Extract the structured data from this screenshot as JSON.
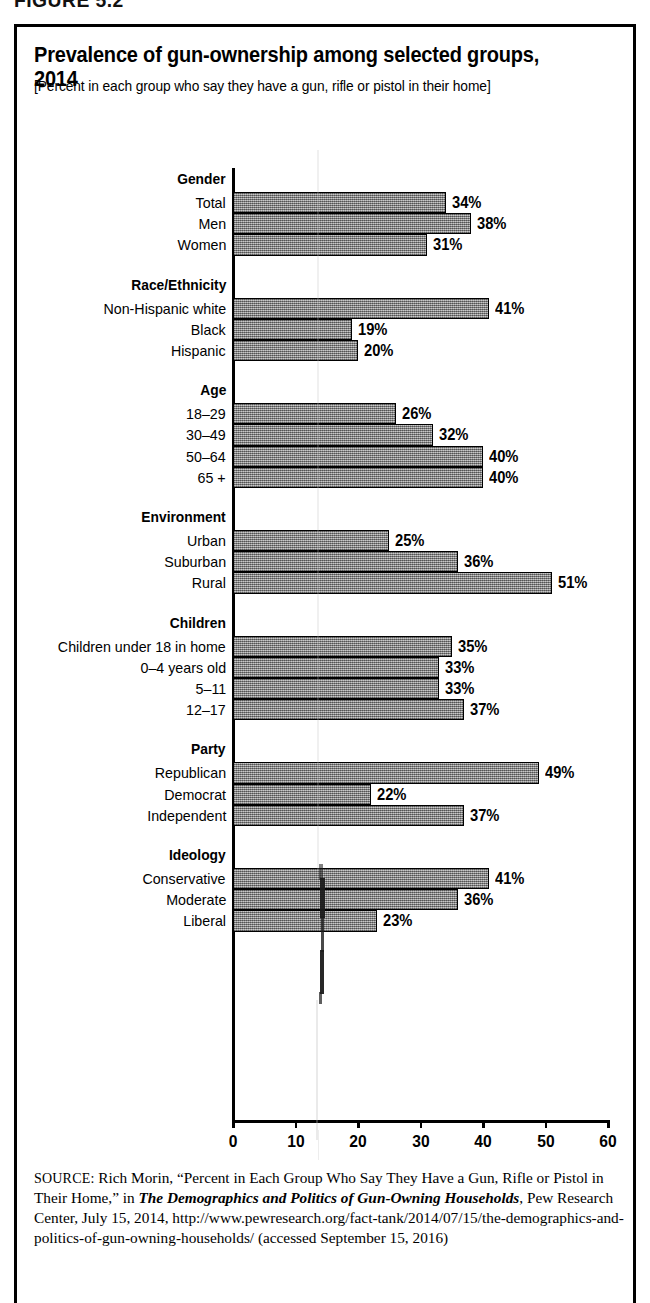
{
  "figure_label": "FIGURE 5.2",
  "title": "Prevalence of gun-ownership among selected groups, 2014",
  "subtitle": "[Percent in each group who say they have a gun, rifle or pistol in their home]",
  "source": {
    "prefix": "SOURCE:",
    "part1": " Rich Morin, “Percent in Each Group Who Say They Have a Gun, Rifle or Pistol in Their Home,” in ",
    "italic1": "The Demographics and Politics of Gun-Owning Households",
    "part2": ", Pew Research Center, July 15, 2014, http://www.pewresearch.org/fact-tank/2014/07/15/the-demographics-and-politics-of-gun-owning-households/ (accessed September 15, 2016)"
  },
  "chart_data": {
    "type": "bar",
    "orientation": "horizontal",
    "title": "Prevalence of gun-ownership among selected groups, 2014",
    "subtitle": "[Percent in each group who say they have a gun, rifle or pistol in their home]",
    "xlabel": "",
    "ylabel": "",
    "xlim": [
      0,
      60
    ],
    "xticks": [
      0,
      10,
      20,
      30,
      40,
      50,
      60
    ],
    "tick_labels": [
      "0",
      "10",
      "20",
      "30",
      "40",
      "50",
      "60"
    ],
    "grid": false,
    "legend": "none",
    "value_suffix": "%",
    "groups": [
      {
        "name": "Gender",
        "categories": [
          "Total",
          "Men",
          "Women"
        ],
        "values": [
          34,
          38,
          31
        ],
        "value_labels": [
          "34%",
          "38%",
          "31%"
        ]
      },
      {
        "name": "Race/Ethnicity",
        "categories": [
          "Non-Hispanic white",
          "Black",
          "Hispanic"
        ],
        "values": [
          41,
          19,
          20
        ],
        "value_labels": [
          "41%",
          "19%",
          "20%"
        ]
      },
      {
        "name": "Age",
        "categories": [
          "18–29",
          "30–49",
          "50–64",
          "65 +"
        ],
        "values": [
          26,
          32,
          40,
          40
        ],
        "value_labels": [
          "26%",
          "32%",
          "40%",
          "40%"
        ]
      },
      {
        "name": "Environment",
        "categories": [
          "Urban",
          "Suburban",
          "Rural"
        ],
        "values": [
          25,
          36,
          51
        ],
        "value_labels": [
          "25%",
          "36%",
          "51%"
        ]
      },
      {
        "name": "Children",
        "categories": [
          "Children under 18 in home",
          "0–4 years old",
          "5–11",
          "12–17"
        ],
        "values": [
          35,
          33,
          33,
          37
        ],
        "value_labels": [
          "35%",
          "33%",
          "33%",
          "37%"
        ]
      },
      {
        "name": "Party",
        "categories": [
          "Republican",
          "Democrat",
          "Independent"
        ],
        "values": [
          49,
          22,
          37
        ],
        "value_labels": [
          "49%",
          "22%",
          "37%"
        ]
      },
      {
        "name": "Ideology",
        "categories": [
          "Conservative",
          "Moderate",
          "Liberal"
        ],
        "values": [
          41,
          36,
          23
        ],
        "value_labels": [
          "41%",
          "36%",
          "23%"
        ]
      }
    ]
  },
  "colors": {
    "bar_fill": "#9a9a9a",
    "bar_border": "#000000",
    "axis": "#000000",
    "frame": "#000000",
    "background": "#ffffff"
  }
}
